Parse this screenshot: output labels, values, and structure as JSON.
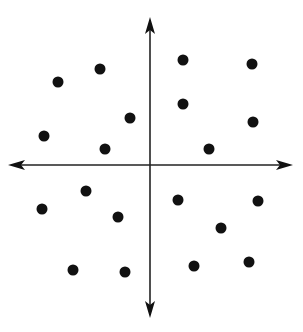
{
  "diagram": {
    "type": "coordinate-plane-scatter",
    "background": "#ffffff",
    "ink_color": "#111111",
    "axis_color": "#222222",
    "origin": {
      "x": 150,
      "y": 165
    },
    "axes": {
      "x_axis": {
        "from": {
          "x": 8,
          "y": 165
        },
        "to": {
          "x": 293,
          "y": 165
        },
        "arrows": [
          "left",
          "right"
        ]
      },
      "y_axis": {
        "from": {
          "x": 150,
          "y": 17
        },
        "to": {
          "x": 150,
          "y": 318
        },
        "arrows": [
          "up",
          "down"
        ]
      }
    },
    "point_radius": 5.5,
    "quadrants": [
      {
        "name": "quadrant-1",
        "points": [
          {
            "x": 183,
            "y": 60
          },
          {
            "x": 252,
            "y": 64
          },
          {
            "x": 183,
            "y": 104
          },
          {
            "x": 253,
            "y": 122
          },
          {
            "x": 209,
            "y": 149
          }
        ]
      },
      {
        "name": "quadrant-2",
        "points": [
          {
            "x": 58,
            "y": 82
          },
          {
            "x": 100,
            "y": 69
          },
          {
            "x": 130,
            "y": 118
          },
          {
            "x": 44,
            "y": 136
          },
          {
            "x": 105,
            "y": 149
          }
        ]
      },
      {
        "name": "quadrant-3",
        "points": [
          {
            "x": 86,
            "y": 191
          },
          {
            "x": 42,
            "y": 209
          },
          {
            "x": 118,
            "y": 217
          },
          {
            "x": 73,
            "y": 270
          },
          {
            "x": 125,
            "y": 272
          }
        ]
      },
      {
        "name": "quadrant-4",
        "points": [
          {
            "x": 178,
            "y": 200
          },
          {
            "x": 258,
            "y": 201
          },
          {
            "x": 221,
            "y": 228
          },
          {
            "x": 194,
            "y": 266
          },
          {
            "x": 249,
            "y": 262
          }
        ]
      }
    ]
  }
}
